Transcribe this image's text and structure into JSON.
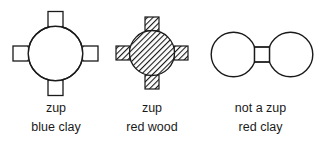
{
  "figure": {
    "stroke_color": "#1a1a1a",
    "fill_white": "#ffffff",
    "hatch_color": "#1a1a1a",
    "items": [
      {
        "id": "zup-blue-clay",
        "shape_name": "circle-with-four-squares-outline",
        "verdict": "zup",
        "material": "blue clay",
        "filled": false,
        "center": [
          55.5,
          53.5
        ],
        "radius": 27.5,
        "square_size": 15,
        "square_positions": [
          "north",
          "east",
          "south",
          "west"
        ]
      },
      {
        "id": "zup-red-wood",
        "shape_name": "circle-with-four-squares-hatched",
        "verdict": "zup",
        "material": "red wood",
        "filled": true,
        "center": [
          152,
          53
        ],
        "radius": 22.5,
        "square_size": 14,
        "square_positions": [
          "north",
          "east",
          "south",
          "west"
        ]
      },
      {
        "id": "not-a-zup-red-clay",
        "shape_name": "two-circles-joined-by-square",
        "verdict": "not a zup",
        "material": "red clay",
        "filled": false,
        "left_circle_center": [
          233.5,
          54.5
        ],
        "right_circle_center": [
          290.5,
          54.5
        ],
        "radius": 22.5,
        "square_size": 15
      }
    ]
  },
  "captions": {
    "first": {
      "verdict": "zup",
      "material": "blue clay"
    },
    "second": {
      "verdict": "zup",
      "material": "red wood"
    },
    "third": {
      "verdict": "not a zup",
      "material": "red clay"
    }
  }
}
